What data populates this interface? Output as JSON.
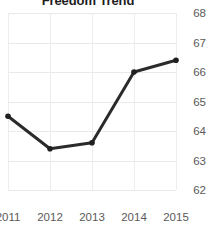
{
  "chart_data": {
    "type": "line",
    "title": "Freedom Trend",
    "xlabel": "",
    "ylabel": "",
    "categories": [
      "2011",
      "2012",
      "2013",
      "2014",
      "2015"
    ],
    "x": [
      2011,
      2012,
      2013,
      2014,
      2015
    ],
    "values": [
      64.5,
      63.4,
      63.6,
      66.0,
      66.4
    ],
    "series": [
      {
        "name": "Freedom Trend",
        "values": [
          64.5,
          63.4,
          63.6,
          66.0,
          66.4
        ]
      }
    ],
    "ylim": [
      62,
      68
    ],
    "xlim": [
      2011,
      2015
    ],
    "y_ticks": [
      62,
      63,
      64,
      65,
      66,
      67,
      68
    ],
    "y_tick_labels": [
      "62",
      "63",
      "64",
      "65",
      "66",
      "67",
      "68"
    ],
    "x_ticks": [
      2011,
      2012,
      2013,
      2014,
      2015
    ],
    "x_tick_labels": [
      "2011",
      "2012",
      "2013",
      "2014",
      "2015"
    ],
    "grid": true,
    "grid_axis": "both",
    "legend": false,
    "legend_position": "none",
    "y_axis_position": "right",
    "markers": true,
    "marker_shape": "circle",
    "line_color": "#2b2b2b",
    "marker_color": "#1f1f1f",
    "grid_color": "#e9e9e9",
    "tick_label_color": "#5a5a5a",
    "title_color": "#1d1d1d",
    "background_color": "#ffffff",
    "line_width": 3
  }
}
